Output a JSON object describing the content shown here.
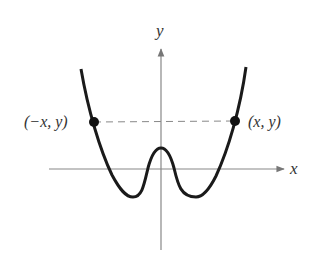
{
  "diagram": {
    "axes": {
      "x_label": "x",
      "y_label": "y"
    },
    "points": [
      {
        "label": "(−x, y)",
        "side": "left"
      },
      {
        "label": "(x, y)",
        "side": "right"
      }
    ],
    "colors": {
      "curve": "#1a1a1a",
      "axes": "#777777",
      "dashed": "#888888",
      "text": "#333333"
    }
  }
}
